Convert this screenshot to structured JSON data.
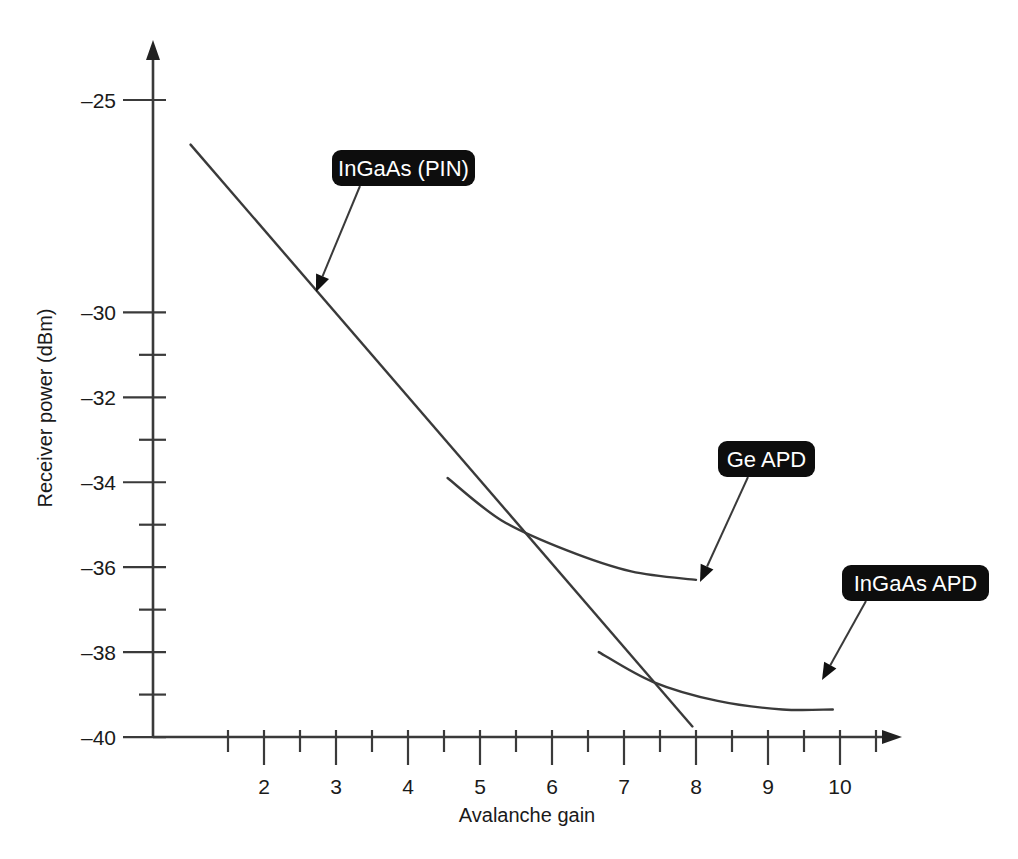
{
  "chart_data": {
    "type": "line",
    "title": "",
    "xlabel": "Avalanche gain",
    "ylabel": "Receiver power (dBm)",
    "xlim": [
      1,
      11
    ],
    "ylim": [
      -40,
      -24
    ],
    "grid": false,
    "legend_position": "inline-callouts",
    "x_ticks_major": [
      "2",
      "3",
      "4",
      "5",
      "6",
      "7",
      "8",
      "9",
      "10"
    ],
    "x_ticks_major_values": [
      2,
      3,
      4,
      5,
      6,
      7,
      8,
      9,
      10
    ],
    "x_minor_ticks": [
      1.5,
      2.5,
      3.5,
      4.5,
      5.5,
      6.5,
      7.5,
      8.5,
      9.5,
      10.5
    ],
    "y_ticks_major": [
      "-25",
      "-30",
      "-32",
      "-34",
      "-36",
      "-38",
      "-40"
    ],
    "y_ticks_major_values": [
      -25,
      -30,
      -32,
      -34,
      -36,
      -38,
      -40
    ],
    "y_minor_ticks": [
      -31,
      -33,
      -35,
      -37,
      -39
    ],
    "series": [
      {
        "name": "InGaAs (PIN)",
        "kind": "straight-line",
        "points": [
          [
            0.98,
            -26.05
          ],
          [
            7.95,
            -39.75
          ]
        ]
      },
      {
        "name": "Ge APD",
        "kind": "curve",
        "points": [
          [
            4.55,
            -33.9
          ],
          [
            5.3,
            -34.9
          ],
          [
            6.2,
            -35.6
          ],
          [
            7.1,
            -36.1
          ],
          [
            8.0,
            -36.3
          ]
        ]
      },
      {
        "name": "InGaAs APD",
        "kind": "curve",
        "points": [
          [
            6.65,
            -38.0
          ],
          [
            7.4,
            -38.7
          ],
          [
            8.3,
            -39.15
          ],
          [
            9.2,
            -39.35
          ],
          [
            9.9,
            -39.35
          ]
        ]
      }
    ],
    "annotations": [
      {
        "label": "InGaAs (PIN)",
        "box_x": 332,
        "box_y": 150,
        "box_w": 143,
        "box_h": 36,
        "leader_from": [
          360,
          186
        ],
        "leader_to": [
          316,
          292
        ],
        "style": "black-rounded-callout"
      },
      {
        "label": "Ge APD",
        "box_x": 718,
        "box_y": 441,
        "box_w": 97,
        "box_h": 36,
        "leader_from": [
          748,
          477
        ],
        "leader_to": [
          700,
          582
        ],
        "style": "black-rounded-callout"
      },
      {
        "label": "InGaAs APD",
        "box_x": 842,
        "box_y": 565,
        "box_w": 147,
        "box_h": 36,
        "leader_from": [
          866,
          601
        ],
        "leader_to": [
          822,
          680
        ],
        "style": "black-rounded-callout"
      }
    ],
    "colors": {
      "background": "#ffffff",
      "axis": "#3a3a3a",
      "curve": "#3a3a3a",
      "callout_background": "#0d0d0d",
      "callout_text": "#ffffff"
    }
  },
  "figure": {
    "xlabel": "Avalanche gain",
    "ylabel": "Receiver power (dBm)"
  }
}
